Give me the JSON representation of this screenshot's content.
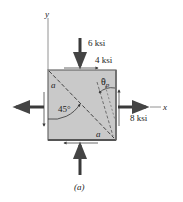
{
  "figure": {
    "caption": "(a)",
    "axes": {
      "x_label": "x",
      "y_label": "y"
    },
    "stresses": {
      "normal_y": "6 ksi",
      "shear": "4 ksi",
      "normal_x": "8 ksi"
    },
    "angles": {
      "principal": "θ",
      "principal_sub": "p",
      "diagonal": "45°"
    },
    "plane_labels": [
      "a",
      "a"
    ],
    "colors": {
      "element_fill": "#c9c9c9",
      "element_edge": "#6a6a6a",
      "arrow": "#3a3a3a",
      "text": "#222222"
    }
  }
}
